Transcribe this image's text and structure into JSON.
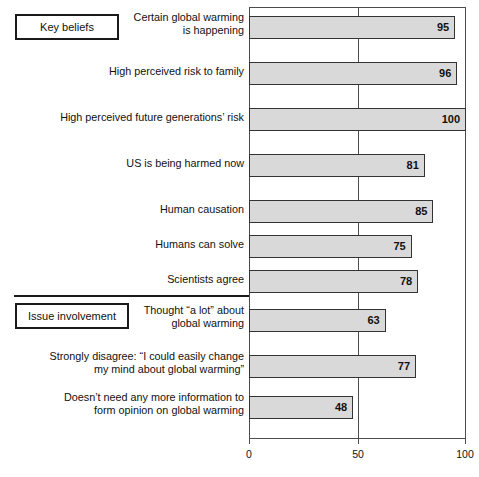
{
  "chart_data": {
    "type": "bar",
    "orientation": "horizontal",
    "title": "",
    "xlabel": "",
    "ylabel": "",
    "xlim": [
      0,
      100
    ],
    "xticks": [
      0,
      50,
      100
    ],
    "xtick_labels": [
      "0",
      "50",
      "100"
    ],
    "grid": true,
    "gridlines_at": [
      50
    ],
    "legend": null,
    "bar_color": "#d9d9d9",
    "bar_border_color": "#333333",
    "categories": [
      "Certain global warming is happening",
      "High perceived risk to family",
      "High perceived future generations' risk",
      "US is being harmed now",
      "Human causation",
      "Humans can solve",
      "Scientists agree",
      "Thought “a lot” about global warming",
      "Strongly disagree: “I could easily change my mind about global warming”",
      "Doesn't need any more information to form opinion on global warming"
    ],
    "values": [
      95,
      96,
      100,
      81,
      85,
      75,
      78,
      63,
      77,
      48
    ],
    "groups": [
      {
        "label": "Key beliefs",
        "category_indices": [
          0,
          1,
          2,
          3,
          4,
          5,
          6
        ]
      },
      {
        "label": "Issue involvement",
        "category_indices": [
          7,
          8,
          9
        ]
      }
    ]
  },
  "groups": {
    "key_beliefs": "Key beliefs",
    "issue_involvement": "Issue involvement"
  },
  "axis": {
    "tick_0": "0",
    "tick_50": "50",
    "tick_100": "100"
  },
  "rows": [
    {
      "line1": "Certain global warming",
      "line2": "is happening",
      "value": "95",
      "value_num": 95
    },
    {
      "line1": "High perceived risk to family",
      "line2": "",
      "value": "96",
      "value_num": 96
    },
    {
      "line1": "High perceived future generations’ risk",
      "line2": "",
      "value": "100",
      "value_num": 100
    },
    {
      "line1": "US is being harmed now",
      "line2": "",
      "value": "81",
      "value_num": 81
    },
    {
      "line1": "Human causation",
      "line2": "",
      "value": "85",
      "value_num": 85
    },
    {
      "line1": "Humans can solve",
      "line2": "",
      "value": "75",
      "value_num": 75
    },
    {
      "line1": "Scientists agree",
      "line2": "",
      "value": "78",
      "value_num": 78
    },
    {
      "line1": "Thought “a lot” about",
      "line2": "global warming",
      "value": "63",
      "value_num": 63
    },
    {
      "line1": "Strongly disagree: “I could easily change",
      "line2": "my mind about global warming”",
      "value": "77",
      "value_num": 77
    },
    {
      "line1": "Doesn’t need any more information to",
      "line2": "form opinion on global warming",
      "value": "48",
      "value_num": 48
    }
  ],
  "caption": ""
}
